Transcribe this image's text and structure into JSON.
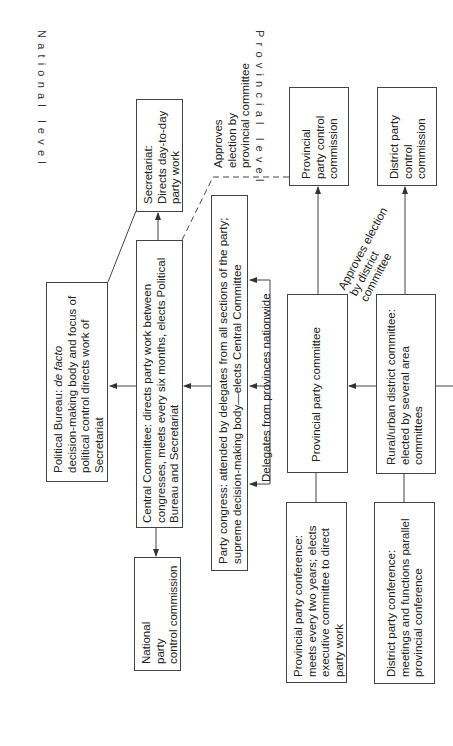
{
  "diagram": {
    "orientation": "rotated-90",
    "level_labels": {
      "national": "National level",
      "provincial": "Provincial level"
    },
    "nodes": {
      "secretariat": "Secretariat:\nDirects day-to-day\nparty work",
      "political_bureau_title": "Political Bureau: ",
      "political_bureau_italic": "de facto",
      "political_bureau_rest": "decision-making body and focus of\npolitical control directs work of\nSecretariat",
      "central_committee": "Central Committee: directs party work between\ncongresses, meets every six months, elects Political\nBureau and Secretariat",
      "national_control": "National\nparty\ncontrol commission",
      "party_congress": "Party congress: attended by delegates from all sections of the party;\nsupreme decision-making body—elects Central Committee",
      "provincial_control": "Provincial\nparty control\ncommission",
      "district_control": "District party\ncontrol\ncommission",
      "provincial_committee": "Provincial party committee",
      "district_committee": "Rural/urban district committee:\nelected by several area\ncommittees",
      "provincial_conference": "Provincial party conference:\nmeets every two years; elects\nexecutive committee to direct\nparty work",
      "district_conference": "District party conference:\nmeetings and functions parallel\nprovincial conference"
    },
    "edge_labels": {
      "approves_provincial": "Approves\nelection by\nprovincial committee",
      "approves_district": "Approves election\nby district\ncommittee",
      "delegates": "Delegates from provinces nationwide"
    },
    "colors": {
      "line": "#444444",
      "text": "#222222",
      "background": "#ffffff"
    }
  }
}
